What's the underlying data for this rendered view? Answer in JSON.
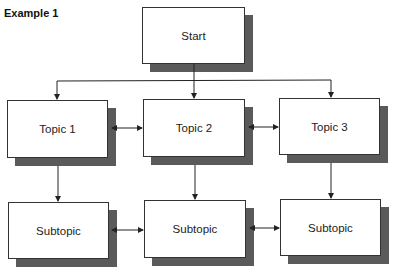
{
  "title": "Example 1",
  "nodes": {
    "start": "Start",
    "topic1": "Topic 1",
    "topic2": "Topic 2",
    "topic3": "Topic 3",
    "sub1": "Subtopic",
    "sub2": "Subtopic",
    "sub3": "Subtopic"
  },
  "edges": [
    {
      "from": "start",
      "to": "topic1",
      "type": "arrow"
    },
    {
      "from": "start",
      "to": "topic2",
      "type": "arrow"
    },
    {
      "from": "start",
      "to": "topic3",
      "type": "arrow"
    },
    {
      "from": "topic1",
      "to": "topic2",
      "type": "double-arrow"
    },
    {
      "from": "topic2",
      "to": "topic3",
      "type": "double-arrow"
    },
    {
      "from": "topic1",
      "to": "sub1",
      "type": "arrow"
    },
    {
      "from": "topic2",
      "to": "sub2",
      "type": "arrow"
    },
    {
      "from": "topic3",
      "to": "sub3",
      "type": "arrow"
    },
    {
      "from": "sub1",
      "to": "sub2",
      "type": "double-arrow"
    },
    {
      "from": "sub2",
      "to": "sub3",
      "type": "double-arrow"
    }
  ],
  "colors": {
    "shadow": "#5a5a5a",
    "border": "#333333",
    "line": "#222222"
  }
}
